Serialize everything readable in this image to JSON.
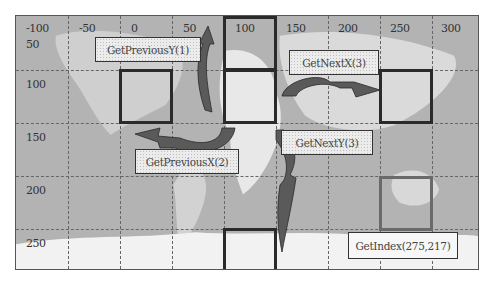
{
  "diagram": {
    "type": "grid-navigation-over-world-map",
    "x_axis_ticks": [
      "-100",
      "-50",
      "0",
      "50",
      "100",
      "150",
      "200",
      "250",
      "300"
    ],
    "y_axis_ticks": [
      "50",
      "100",
      "150",
      "200",
      "250"
    ],
    "highlighted_cells": [
      {
        "id": "prev-y-source",
        "col": 2,
        "row": 1
      },
      {
        "id": "center-top",
        "col": 4,
        "row": 0
      },
      {
        "id": "center",
        "col": 4,
        "row": 1
      },
      {
        "id": "next-x-target",
        "col": 7,
        "row": 1
      },
      {
        "id": "next-y-target",
        "col": 4,
        "row": 4
      },
      {
        "id": "index-target",
        "col": 7,
        "row": 3
      }
    ],
    "labels": {
      "get_previous_y": "GetPreviousY(1)",
      "get_next_x": "GetNextX(3)",
      "get_previous_x": "GetPreviousX(2)",
      "get_next_y": "GetNextY(3)",
      "get_index": "GetIndex(275,217)"
    },
    "colors": {
      "map_sea": "#b5b5b5",
      "map_land": "#e6e6e6",
      "grid": "#666666",
      "cell_border": "#2a2a2a",
      "arrow_fill": "#5a5a5a"
    }
  }
}
